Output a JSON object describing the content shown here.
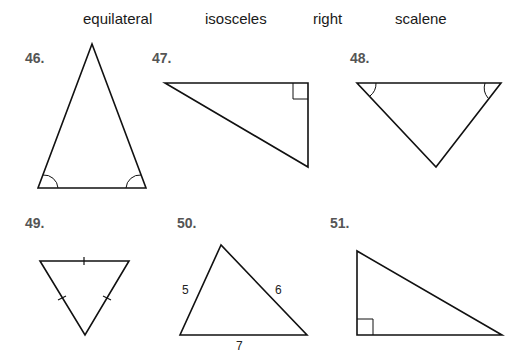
{
  "word_bank": [
    "equilateral",
    "isosceles",
    "right",
    "scalene"
  ],
  "problems": [
    {
      "number": "46.",
      "marks": "two congruent base angles"
    },
    {
      "number": "47.",
      "marks": "right angle"
    },
    {
      "number": "48.",
      "marks": "two congruent angles"
    },
    {
      "number": "49.",
      "marks": "three congruent sides"
    },
    {
      "number": "50.",
      "side_labels": [
        "5",
        "6",
        "7"
      ]
    },
    {
      "number": "51.",
      "marks": "right angle"
    }
  ],
  "colors": {
    "line": "#111111",
    "number": "#555555"
  }
}
